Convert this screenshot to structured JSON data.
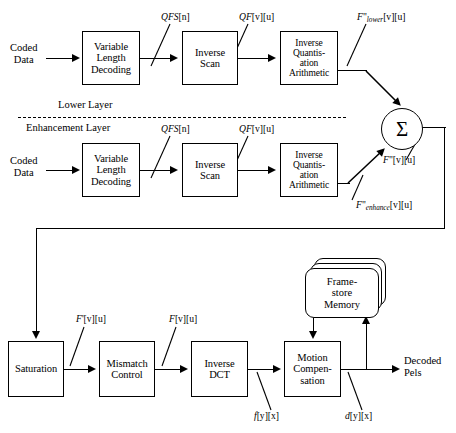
{
  "diagram": {
    "layers": {
      "lower_label": "Lower Layer",
      "enhancement_label": "Enhancement Layer"
    },
    "lower_row": {
      "input_label_line1": "Coded",
      "input_label_line2": "Data",
      "blocks": [
        {
          "id": "vld-lower",
          "line1": "Variable",
          "line2": "Length",
          "line3": "Decoding"
        },
        {
          "id": "iscan-lower",
          "line1": "Inverse",
          "line2": "Scan"
        },
        {
          "id": "iq-lower",
          "line1": "Inverse",
          "line2": "Quantis-",
          "line3": "ation",
          "line4": "Arithmetic"
        }
      ],
      "signals": [
        {
          "id": "qfs-lower",
          "base": "QFS",
          "index": "[n]"
        },
        {
          "id": "qf-lower",
          "base": "QF",
          "index": "[v][u]"
        },
        {
          "id": "fpp-lower",
          "base": "F",
          "primes": "\"",
          "sub": "lower",
          "index": "[v][u]"
        }
      ]
    },
    "enhancement_row": {
      "input_label_line1": "Coded",
      "input_label_line2": "Data",
      "blocks": [
        {
          "id": "vld-enh",
          "line1": "Variable",
          "line2": "Length",
          "line3": "Decoding"
        },
        {
          "id": "iscan-enh",
          "line1": "Inverse",
          "line2": "Scan"
        },
        {
          "id": "iq-enh",
          "line1": "Inverse",
          "line2": "Quantis-",
          "line3": "ation",
          "line4": "Arithmetic"
        }
      ],
      "signals": [
        {
          "id": "qfs-enh",
          "base": "QFS",
          "index": "[n]"
        },
        {
          "id": "qf-enh",
          "base": "QF",
          "index": "[v][u]"
        },
        {
          "id": "fpp-enhance",
          "base": "F",
          "primes": "\"",
          "sub": "enhance",
          "index": "[v][u]"
        }
      ]
    },
    "summation": {
      "symbol": "Σ",
      "output_signal": {
        "base": "F",
        "primes": "\"",
        "index": "[v][u]"
      }
    },
    "reconstruction_row": {
      "blocks": [
        {
          "id": "saturation",
          "line1": "Saturation"
        },
        {
          "id": "mismatch",
          "line1": "Mismatch",
          "line2": "Control"
        },
        {
          "id": "idct",
          "line1": "Inverse",
          "line2": "DCT"
        },
        {
          "id": "motion-comp",
          "line1": "Motion",
          "line2": "Compen-",
          "line3": "sation"
        }
      ],
      "frame_store": {
        "line1": "Frame-",
        "line2": "store",
        "line3": "Memory"
      },
      "signals": [
        {
          "id": "f-prime",
          "base": "F",
          "primes": "'",
          "index": "[v][u]"
        },
        {
          "id": "f-plain",
          "base": "F",
          "primes": "",
          "index": "[v][u]"
        },
        {
          "id": "f-small",
          "base": "f",
          "primes": "",
          "index": "[y][x]"
        },
        {
          "id": "d-small",
          "base": "d",
          "primes": "",
          "index": "[y][x]"
        }
      ],
      "output_label_line1": "Decoded",
      "output_label_line2": "Pels"
    },
    "colors": {
      "stroke": "#000000",
      "background": "#ffffff"
    }
  }
}
